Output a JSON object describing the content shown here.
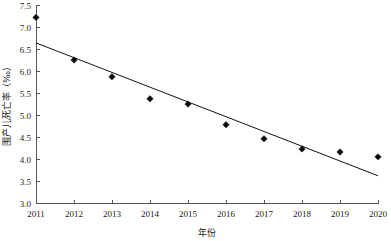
{
  "chart_data": {
    "type": "scatter",
    "title": "",
    "xlabel": "年份",
    "ylabel": "围产儿死亡率（‰）",
    "categories": [
      "2011",
      "2012",
      "2013",
      "2014",
      "2015",
      "2016",
      "2017",
      "2018",
      "2019",
      "2020"
    ],
    "x": [
      2011,
      2012,
      2013,
      2014,
      2015,
      2016,
      2017,
      2018,
      2019,
      2020
    ],
    "values": [
      7.23,
      6.26,
      5.88,
      5.38,
      5.26,
      4.79,
      4.47,
      4.24,
      4.17,
      4.06
    ],
    "series": [
      {
        "name": "围产儿死亡率",
        "type": "scatter",
        "marker": "diamond",
        "color": "#0a0a0a",
        "values": [
          7.23,
          6.26,
          5.88,
          5.38,
          5.26,
          4.79,
          4.47,
          4.24,
          4.17,
          4.06
        ]
      },
      {
        "name": "趋势线",
        "type": "line",
        "color": "#111111",
        "endpoints": [
          {
            "x": 2011,
            "y": 6.65
          },
          {
            "x": 2020,
            "y": 3.63
          }
        ]
      }
    ],
    "xlim": [
      2011,
      2020
    ],
    "ylim": [
      3.0,
      7.5
    ],
    "ytick_labels": [
      "3.0",
      "3.5",
      "4.0",
      "4.5",
      "5.0",
      "5.5",
      "6.0",
      "6.5",
      "7.0",
      "7.5"
    ],
    "ytick_values": [
      3.0,
      3.5,
      4.0,
      4.5,
      5.0,
      5.5,
      6.0,
      6.5,
      7.0,
      7.5
    ],
    "xtick_labels": [
      "2011",
      "2012",
      "2013",
      "2014",
      "2015",
      "2016",
      "2017",
      "2018",
      "2019",
      "2020"
    ],
    "grid": false,
    "legend": "none",
    "spines": [
      "left",
      "bottom"
    ]
  },
  "axes": {
    "y_axis_label": "围产儿死亡率（‰）",
    "x_axis_label": "年份"
  }
}
